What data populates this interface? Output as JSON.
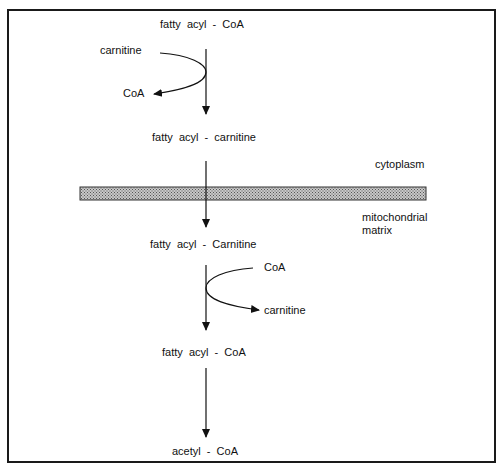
{
  "diagram": {
    "type": "metabolic-pathway",
    "topic": "carnitine shuttle / fatty acid transport into mitochondria",
    "compartments": {
      "upper": "cytoplasm",
      "lower_line1": "mitochondrial",
      "lower_line2": "matrix"
    },
    "nodes": {
      "n1": "fatty  acyl  -  CoA",
      "n2": "fatty  acyl  -  carnitine",
      "n3": "fatty  acyl  -  Carnitine",
      "n4": "fatty  acyl  -  CoA",
      "n5": "acetyl  -  CoA"
    },
    "side_reactions": {
      "step1_in": "carnitine",
      "step1_out": "CoA",
      "step2_in": "CoA",
      "step2_out": "carnitine"
    },
    "edges": [
      {
        "from": "fatty acyl - CoA",
        "to": "fatty acyl - carnitine",
        "in": "carnitine",
        "out": "CoA"
      },
      {
        "from": "fatty acyl - carnitine",
        "to": "fatty acyl - Carnitine",
        "crosses": "membrane"
      },
      {
        "from": "fatty acyl - Carnitine",
        "to": "fatty acyl - CoA",
        "in": "CoA",
        "out": "carnitine"
      },
      {
        "from": "fatty acyl - CoA",
        "to": "acetyl - CoA"
      }
    ],
    "colors": {
      "ink": "#111111",
      "membrane_fill": "#b0b0b0",
      "membrane_border": "#333333",
      "background": "#ffffff"
    }
  }
}
